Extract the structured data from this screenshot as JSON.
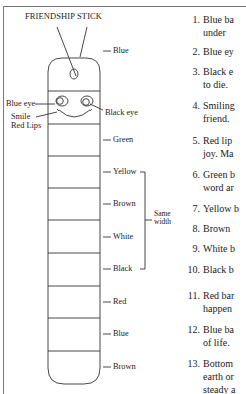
{
  "title": "FRIENDSHIP STICK",
  "diagram": {
    "face_labels": {
      "blue_eye": "Blue eye",
      "black_eye": "Black eye",
      "smile": "Smile",
      "red_lips": "Red Lips"
    },
    "band_labels": [
      {
        "label": "Blue",
        "y": 51
      },
      {
        "label": "Green",
        "y": 140
      },
      {
        "label": "Yellow",
        "y": 172
      },
      {
        "label": "Brown",
        "y": 204
      },
      {
        "label": "White",
        "y": 237
      },
      {
        "label": "Black",
        "y": 269
      },
      {
        "label": "Red",
        "y": 302
      },
      {
        "label": "Blue",
        "y": 334
      },
      {
        "label": "Brown",
        "y": 367
      }
    ],
    "bracket_label_line1": "Same",
    "bracket_label_line2": "width"
  },
  "list": [
    {
      "num": "1.",
      "lines": [
        "Blue ba",
        "under "
      ]
    },
    {
      "num": "2.",
      "lines": [
        "Blue ey"
      ]
    },
    {
      "num": "3.",
      "lines": [
        "Black e",
        "to die."
      ]
    },
    {
      "num": "4.",
      "lines": [
        "Smiling",
        "friend."
      ]
    },
    {
      "num": "5.",
      "lines": [
        "Red lip",
        "joy. Ma"
      ]
    },
    {
      "num": "6.",
      "lines": [
        "Green b",
        "word ar"
      ]
    },
    {
      "num": "7.",
      "lines": [
        "Yellow b"
      ]
    },
    {
      "num": "8.",
      "lines": [
        "Brown"
      ]
    },
    {
      "num": "9.",
      "lines": [
        "White b"
      ]
    },
    {
      "num": "10.",
      "lines": [
        "Black b"
      ]
    },
    {
      "num": "11.",
      "lines": [
        "Red bar",
        "happen"
      ]
    },
    {
      "num": "12.",
      "lines": [
        "Blue ba",
        "of life."
      ]
    },
    {
      "num": "13.",
      "lines": [
        "Bottom",
        "earth or",
        "steady a"
      ]
    }
  ]
}
